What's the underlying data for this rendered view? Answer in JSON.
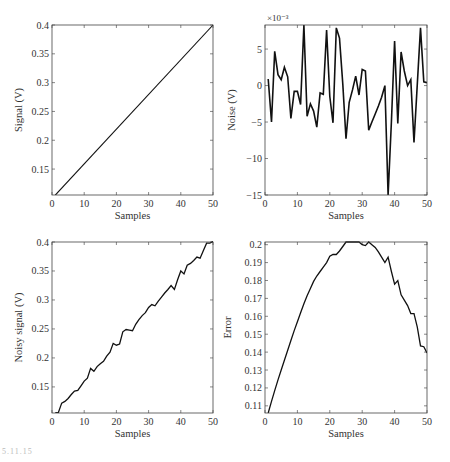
{
  "figure": {
    "label": "5.11.15"
  },
  "chart_data": [
    {
      "id": "signal",
      "type": "line",
      "title": "",
      "xlabel": "Samples",
      "ylabel": "Signal (V)",
      "xlim": [
        0,
        50
      ],
      "ylim": [
        0.105,
        0.4
      ],
      "xticks": [
        0,
        10,
        20,
        30,
        40,
        50
      ],
      "xtick_labels": [
        "0",
        "10",
        "20",
        "30",
        "40",
        "50"
      ],
      "yticks": [
        0.15,
        0.2,
        0.25,
        0.3,
        0.35,
        0.4
      ],
      "ytick_labels": [
        "0.15",
        "0.2",
        "0.25",
        "0.3",
        "0.35",
        "0.4"
      ],
      "grid": false,
      "box": {
        "x": 52,
        "y": 25,
        "w": 161,
        "h": 170
      },
      "series": [
        {
          "name": "signal",
          "x": [
            1,
            50
          ],
          "y": [
            0.1047,
            0.4
          ]
        }
      ]
    },
    {
      "id": "noise",
      "type": "line",
      "title": "",
      "xlabel": "Samples",
      "ylabel": "Noise (V)",
      "y_multiplier": "×10⁻³",
      "xlim": [
        0,
        50
      ],
      "ylim": [
        -15,
        8.3
      ],
      "xticks": [
        0,
        10,
        20,
        30,
        40,
        50
      ],
      "xtick_labels": [
        "0",
        "10",
        "20",
        "30",
        "40",
        "50"
      ],
      "yticks": [
        -15,
        -10,
        -5,
        0,
        5
      ],
      "ytick_labels": [
        "−15",
        "−10",
        "−5",
        "0",
        "5"
      ],
      "grid": false,
      "box": {
        "x": 265,
        "y": 25,
        "w": 162,
        "h": 170
      },
      "series": [
        {
          "name": "noise (×10⁻³ V)",
          "x": [
            1,
            2,
            3,
            4,
            5,
            6,
            7,
            8,
            9,
            10,
            11,
            12,
            13,
            14,
            15,
            16,
            17,
            18,
            19,
            20,
            21,
            22,
            23,
            24,
            25,
            26,
            27,
            28,
            29,
            30,
            31,
            32,
            33,
            34,
            35,
            36,
            37,
            38,
            39,
            40,
            41,
            42,
            43,
            44,
            45,
            46,
            47,
            48,
            49,
            50
          ],
          "y": [
            0.9,
            -5.0,
            4.7,
            1.5,
            0.8,
            2.5,
            1.2,
            -4.5,
            -0.8,
            -0.8,
            -2.6,
            8.3,
            -4.2,
            -2.5,
            -3.5,
            -5.7,
            -1.0,
            -1.2,
            7.6,
            -1.5,
            -5.1,
            7.9,
            6.5,
            0.2,
            -7.3,
            -2.3,
            -0.6,
            1.3,
            -1.3,
            2.2,
            2.0,
            -6.1,
            -5.0,
            -3.9,
            -2.8,
            -1.6,
            0.0,
            -15.0,
            -5.0,
            6.1,
            -5.2,
            4.6,
            2.0,
            0.0,
            0.8,
            -7.8,
            0.2,
            7.9,
            0.5,
            0.4
          ]
        }
      ]
    },
    {
      "id": "noisy-signal",
      "type": "line",
      "title": "",
      "xlabel": "Samples",
      "ylabel": "Noisy signal (V)",
      "xlim": [
        0,
        50
      ],
      "ylim": [
        0.105,
        0.4
      ],
      "xticks": [
        0,
        10,
        20,
        30,
        40,
        50
      ],
      "xtick_labels": [
        "0",
        "10",
        "20",
        "30",
        "40",
        "50"
      ],
      "yticks": [
        0.15,
        0.2,
        0.25,
        0.3,
        0.35,
        0.4
      ],
      "ytick_labels": [
        "0.15",
        "0.2",
        "0.25",
        "0.3",
        "0.35",
        "0.4"
      ],
      "grid": false,
      "box": {
        "x": 52,
        "y": 242,
        "w": 161,
        "h": 171
      },
      "series": [
        {
          "name": "noisy signal",
          "x": [
            1,
            2,
            3,
            4,
            5,
            6,
            7,
            8,
            9,
            10,
            11,
            12,
            13,
            14,
            15,
            16,
            17,
            18,
            19,
            20,
            21,
            22,
            23,
            24,
            25,
            26,
            27,
            28,
            29,
            30,
            31,
            32,
            33,
            34,
            35,
            36,
            37,
            38,
            39,
            40,
            41,
            42,
            43,
            44,
            45,
            46,
            47,
            48,
            49,
            50
          ],
          "y": [
            0.105,
            0.106,
            0.122,
            0.125,
            0.13,
            0.137,
            0.143,
            0.144,
            0.152,
            0.16,
            0.165,
            0.182,
            0.177,
            0.185,
            0.19,
            0.194,
            0.203,
            0.21,
            0.225,
            0.222,
            0.224,
            0.245,
            0.249,
            0.248,
            0.247,
            0.258,
            0.266,
            0.273,
            0.278,
            0.287,
            0.292,
            0.29,
            0.298,
            0.305,
            0.312,
            0.318,
            0.325,
            0.318,
            0.335,
            0.35,
            0.345,
            0.36,
            0.363,
            0.368,
            0.374,
            0.372,
            0.385,
            0.398,
            0.398,
            0.401
          ]
        }
      ]
    },
    {
      "id": "error",
      "type": "line",
      "title": "",
      "xlabel": "Samples",
      "ylabel": "Error",
      "xlim": [
        0,
        50
      ],
      "ylim": [
        0.106,
        0.2015
      ],
      "xticks": [
        0,
        10,
        20,
        30,
        40,
        50
      ],
      "xtick_labels": [
        "0",
        "10",
        "20",
        "30",
        "40",
        "50"
      ],
      "yticks": [
        0.11,
        0.12,
        0.13,
        0.14,
        0.15,
        0.16,
        0.17,
        0.18,
        0.19,
        0.2
      ],
      "ytick_labels": [
        "0.11",
        "0.12",
        "0.13",
        "0.14",
        "0.15",
        "0.16",
        "0.17",
        "0.18",
        "0.19",
        "0.2"
      ],
      "grid": false,
      "box": {
        "x": 265,
        "y": 242,
        "w": 162,
        "h": 171
      },
      "series": [
        {
          "name": "error",
          "x": [
            1,
            2,
            3,
            4,
            5,
            6,
            7,
            8,
            9,
            10,
            11,
            12,
            13,
            14,
            15,
            16,
            17,
            18,
            19,
            20,
            21,
            22,
            23,
            24,
            25,
            26,
            27,
            28,
            29,
            30,
            31,
            32,
            33,
            34,
            35,
            36,
            37,
            38,
            39,
            40,
            41,
            42,
            43,
            44,
            45,
            46,
            47,
            48,
            49,
            50
          ],
          "y": [
            0.106,
            0.1125,
            0.1185,
            0.1245,
            0.13,
            0.1355,
            0.141,
            0.1465,
            0.152,
            0.157,
            0.162,
            0.167,
            0.1715,
            0.1755,
            0.1795,
            0.1825,
            0.185,
            0.1875,
            0.19,
            0.1935,
            0.1945,
            0.1945,
            0.1965,
            0.199,
            0.2015,
            0.2015,
            0.2015,
            0.2015,
            0.2015,
            0.2,
            0.1995,
            0.2015,
            0.2,
            0.1985,
            0.196,
            0.193,
            0.19,
            0.193,
            0.185,
            0.178,
            0.18,
            0.172,
            0.169,
            0.166,
            0.1615,
            0.1615,
            0.154,
            0.1435,
            0.143,
            0.1395
          ]
        }
      ]
    }
  ]
}
